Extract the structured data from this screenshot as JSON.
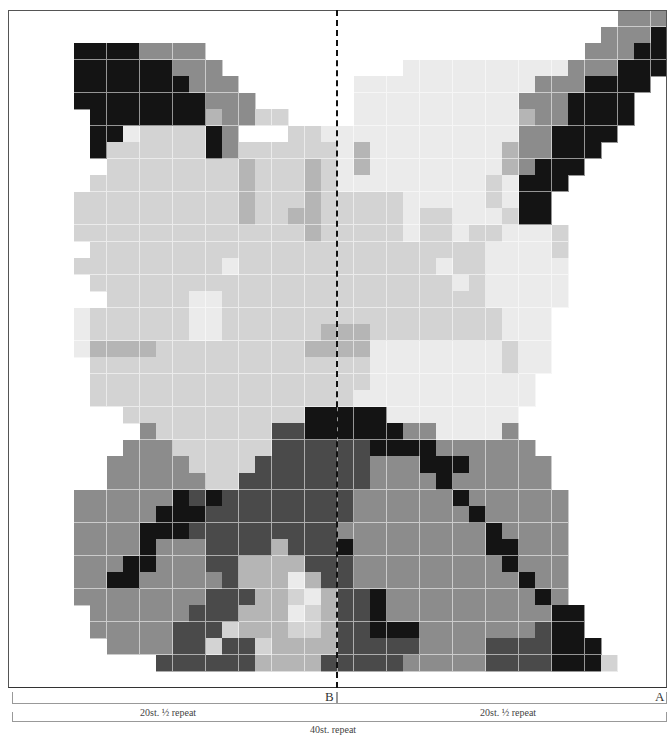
{
  "chart": {
    "columns": 40,
    "rows": 41,
    "palette": {
      "0": "#ffffff",
      "1": "#ebebeb",
      "2": "#d3d3d3",
      "3": "#b5b5b5",
      "4": "#8c8c8c",
      "5": "#4a4a4a",
      "6": "#141414"
    },
    "grid": [
      "0000000000000000000000000000000000000444",
      "0000000000000000000000000000000000004446",
      "0000666644440000000000000000000000044466",
      "0000666666444000000000001111111111444666",
      "0000666666644400000001111111111144466660",
      "0000666666664440000001111111111444666600",
      "0000066666663442200001111111111344666600",
      "0000066122226400022111111111111446666000",
      "0000062222226422222213111111113446660000",
      "0000002222222232223213111111113466600000",
      "0000022222222232223211111111121666000000",
      "0000222222222232223222221111121660000000",
      "0000222222222232233222221221112660000000",
      "0000222222222222223222221221221112000000",
      "0000022222222222222222222222211112000000",
      "0000222222222122222222222212211111000000",
      "0000022222222222222222222221211111000000",
      "0000002222211222222222222222211111000000",
      "0000122222211222222222222222221110000000",
      "0000122222211222222333222222221110000000",
      "0000133332222222223333111111112110000000",
      "0000022222222222222222111111112110000000",
      "0000022222222222222222111111111100000000",
      "0000022222222222222221111111111100000000",
      "0000000222222222226666611111111000000000",
      "0000000042222222556666664411114000000000",
      "0000000444222222555555666644444400000000",
      "0000004444422225555555444666444440000000",
      "0000004444442255555555444464444440000000",
      "0000444444656555555554444446444444000000",
      "0000444446665555555554444444644444000000",
      "0000444466655555555544444444464444000000",
      "0000444464445555355564444444466444000000",
      "0000444664445533335554444444446444000000",
      "0000446644444533313554444444444644000000",
      "0000444444445553321355644444444464000000",
      "0000044444455533312355644444444446600000",
      "0000044444555233322355666444444456600000",
      "0000004444552552333355555444455556660000",
      "0000000005555553333555554444455556662000",
      "0000000000000000000000000000000000000000"
    ],
    "divider": {
      "label_left": "B",
      "label_right": "A"
    },
    "half_repeats": [
      {
        "label": "20st. ½ repeat"
      },
      {
        "label": "20st. ½ repeat"
      }
    ],
    "full_repeat": {
      "label": "40st. repeat"
    }
  }
}
